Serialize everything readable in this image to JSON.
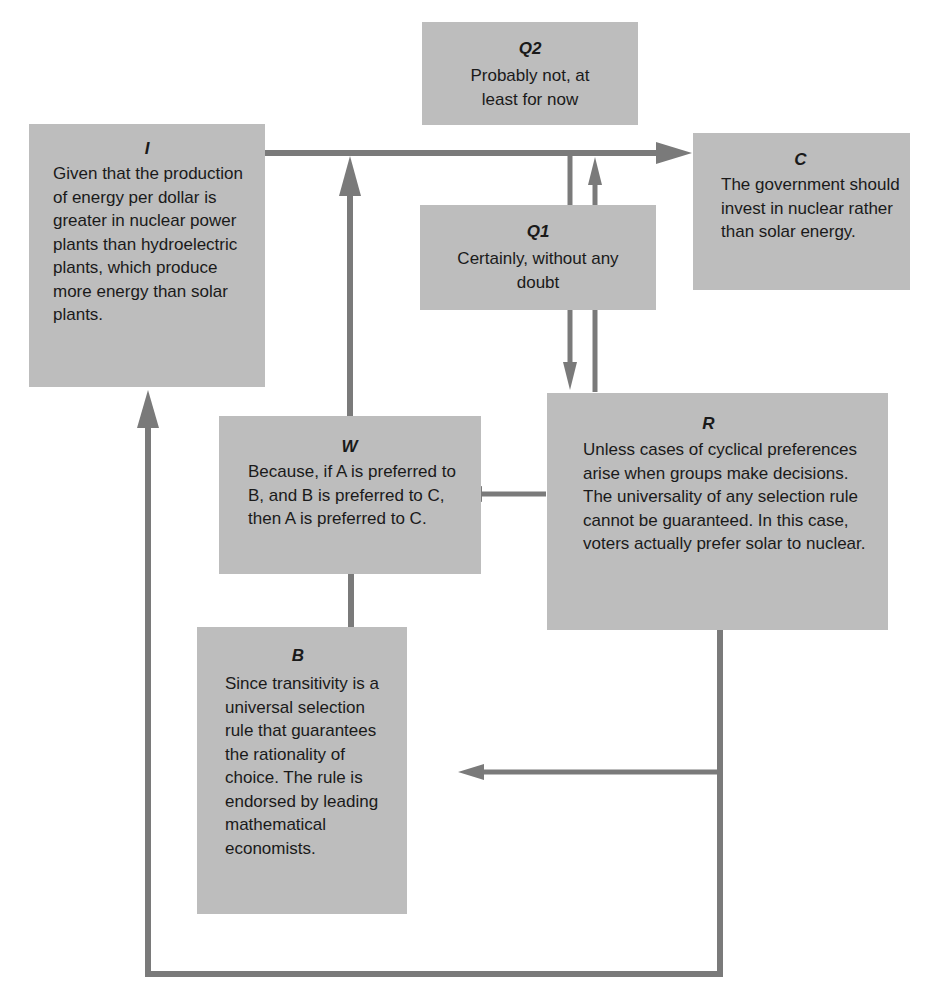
{
  "diagram": {
    "boxes": {
      "I": {
        "label": "I",
        "text": "Given that the production of energy per dollar is greater in nuclear power plants than hydroelectric plants, which produce more energy than solar plants."
      },
      "Q2": {
        "label": "Q2",
        "text": "Probably not, at least for now"
      },
      "Q1": {
        "label": "Q1",
        "text": "Certainly, without any doubt"
      },
      "C": {
        "label": "C",
        "text": "The government should invest in nuclear rather than solar energy."
      },
      "W": {
        "label": "W",
        "text": "Because, if A is preferred to B, and B is preferred to C, then A is preferred to C."
      },
      "R": {
        "label": "R",
        "text": "Unless cases of cyclical preferences arise when groups make decisions. The universality of any selection rule cannot be guaranteed. In this case, voters actually prefer solar to nuclear."
      },
      "B": {
        "label": "B",
        "text": "Since transitivity is a universal selection rule that guarantees the rationality of choice. The rule is endorsed by leading mathematical economists."
      }
    },
    "edges": [
      {
        "from": "I",
        "to": "C"
      },
      {
        "from": "W",
        "to": "I-C"
      },
      {
        "from": "B",
        "to": "W"
      },
      {
        "from": "I-C",
        "to": "R",
        "via": "Q1"
      },
      {
        "from": "R",
        "to": "I-C",
        "via": "Q1"
      },
      {
        "from": "R",
        "to": "W"
      },
      {
        "from": "R",
        "to": "B"
      },
      {
        "from": "R",
        "to": "I"
      }
    ],
    "colors": {
      "box_fill": "#bdbdbd",
      "connector": "#7a7a7a",
      "text": "#1a1a1a"
    }
  }
}
